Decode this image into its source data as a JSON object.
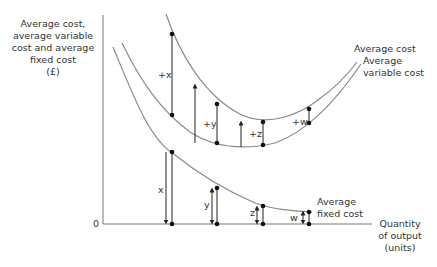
{
  "diagram": {
    "y_axis_label": [
      "Average cost,",
      "average variable",
      "cost and average",
      "fixed cost",
      "(£)"
    ],
    "x_axis_label": [
      "Quantity",
      "of output",
      "(units)"
    ],
    "origin_label": "0",
    "curves": {
      "ac": {
        "label": "Average cost"
      },
      "avc": {
        "label_line1": "Average",
        "label_line2": "variable cost"
      },
      "afc": {
        "label_line1": "Average",
        "label_line2": "fixed cost"
      }
    },
    "differences": {
      "upper": [
        "+x",
        "+y",
        "+z",
        "+w"
      ],
      "lower": [
        "x",
        "y",
        "z",
        "w"
      ]
    },
    "colors": {
      "curve": "#8a8a8a",
      "line": "#222222",
      "axis": "#666666"
    }
  }
}
